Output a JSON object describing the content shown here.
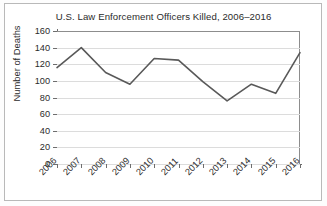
{
  "chart_data": {
    "type": "line",
    "title": "U.S. Law Enforcement Officers Killed, 2006–2016",
    "xlabel": "",
    "ylabel": "Number of Deaths",
    "categories": [
      "2006",
      "2007",
      "2008",
      "2009",
      "2010",
      "2011",
      "2012",
      "2013",
      "2014",
      "2015",
      "2016"
    ],
    "values": [
      116,
      140,
      110,
      96,
      127,
      125,
      99,
      76,
      96,
      85,
      134
    ],
    "series": [
      {
        "name": "Number of Deaths",
        "values": [
          116,
          140,
          110,
          96,
          127,
          125,
          99,
          76,
          96,
          85,
          134
        ]
      }
    ],
    "ylim": [
      0,
      160
    ],
    "yticks": [
      0,
      20,
      40,
      60,
      80,
      100,
      120,
      140,
      160
    ],
    "ytick_labels": [
      "0",
      "20",
      "40",
      "60",
      "80",
      "100",
      "120",
      "140",
      "160"
    ],
    "grid": "horizontal",
    "legend": "none",
    "line_color": "#595959",
    "grid_color": "#dcdcdc",
    "axis_color": "#6e6e6e",
    "background_color": "#ffffff",
    "frame_color": "#b9b9b9",
    "xtick_rotation": -45
  }
}
